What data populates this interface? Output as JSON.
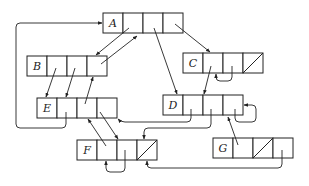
{
  "diagram": {
    "type": "linked-structure",
    "nodes": [
      {
        "id": "A",
        "label": "A",
        "x": 103,
        "y": 13,
        "cells": 4,
        "null_cell": null
      },
      {
        "id": "B",
        "label": "B",
        "x": 27,
        "y": 56,
        "cells": 4,
        "null_cell": null
      },
      {
        "id": "C",
        "label": "C",
        "x": 183,
        "y": 53,
        "cells": 4,
        "null_cell": 3
      },
      {
        "id": "D",
        "label": "D",
        "x": 163,
        "y": 95,
        "cells": 4,
        "null_cell": null
      },
      {
        "id": "E",
        "label": "E",
        "x": 37,
        "y": 98,
        "cells": 4,
        "null_cell": null
      },
      {
        "id": "F",
        "label": "F",
        "x": 77,
        "y": 140,
        "cells": 4,
        "null_cell": 3
      },
      {
        "id": "G",
        "label": "G",
        "x": 213,
        "y": 138,
        "cells": 4,
        "null_cell": 2
      }
    ],
    "edges": [
      {
        "from": "A.1",
        "to": "B"
      },
      {
        "from": "B.3",
        "to": "A"
      },
      {
        "from": "A.2",
        "to": "D"
      },
      {
        "from": "A.3",
        "to": "C"
      },
      {
        "from": "B.1",
        "to": "E"
      },
      {
        "from": "B.2",
        "to": "E"
      },
      {
        "from": "E.2",
        "to": "B"
      },
      {
        "from": "E.1",
        "to": "A"
      },
      {
        "from": "E.3",
        "to": "F"
      },
      {
        "from": "F.1",
        "to": "E"
      },
      {
        "from": "C.1",
        "to": "D"
      },
      {
        "from": "C.2",
        "to": "C"
      },
      {
        "from": "D.1",
        "to": "E"
      },
      {
        "from": "D.2",
        "to": "F"
      },
      {
        "from": "D.3",
        "to": "D"
      },
      {
        "from": "G.1",
        "to": "D"
      },
      {
        "from": "G.3",
        "to": "F"
      },
      {
        "from": "F.2",
        "to": "F"
      }
    ]
  }
}
